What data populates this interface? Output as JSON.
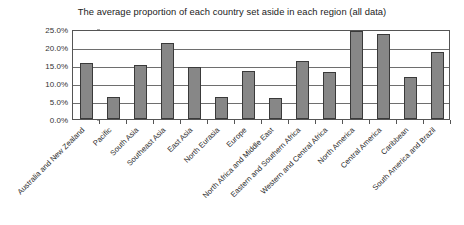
{
  "chart_data": {
    "type": "bar",
    "title": "The average proportion of each country set aside in each region (all data)",
    "xlabel": "",
    "ylabel": "",
    "ylim": [
      0,
      25
    ],
    "ytick_labels": [
      "25.0%",
      "20.0%",
      "15.0%",
      "10.0%",
      "5.0%",
      "0.0%"
    ],
    "ytick_values": [
      25,
      20,
      15,
      10,
      5,
      0
    ],
    "grid": true,
    "legend": "none",
    "categories": [
      "Australia and New Zealand",
      "Pacific",
      "South Asia",
      "Southeast Asia",
      "East Asia",
      "North Eurasia",
      "Europe",
      "North Africa and Middle East",
      "Eastern and Southern Africa",
      "Western and Central Africa",
      "North America",
      "Central America",
      "Caribbean",
      "South America and Brazil"
    ],
    "values": [
      15.6,
      6.2,
      15.0,
      21.0,
      14.5,
      6.2,
      13.2,
      5.8,
      16.2,
      13.0,
      24.5,
      23.5,
      11.7,
      18.5
    ],
    "colors": {
      "bar_fill": "#878787",
      "bar_border": "#3a3a3a",
      "grid": "#6e6e6e",
      "axis": "#555555",
      "background": "#ffffff",
      "text": "#222222"
    }
  }
}
